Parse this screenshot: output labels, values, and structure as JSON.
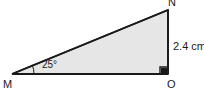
{
  "figure": {
    "type": "right-triangle-diagram",
    "vertices": {
      "m": "M",
      "n": "N",
      "o": "O"
    },
    "labels": {
      "side_no": "2.4 cm",
      "angle_m": "25°"
    },
    "colors": {
      "background": "#ffffff",
      "fill": "#e6e6e6",
      "stroke": "#1a1a1a",
      "text": "#1a1a1a"
    },
    "geometry": {
      "m": [
        12,
        74
      ],
      "n": [
        168,
        10
      ],
      "o": [
        168,
        74
      ],
      "right_angle_at": "O",
      "right_angle_marker_size": 7,
      "angle_arc_radius": 22
    }
  }
}
